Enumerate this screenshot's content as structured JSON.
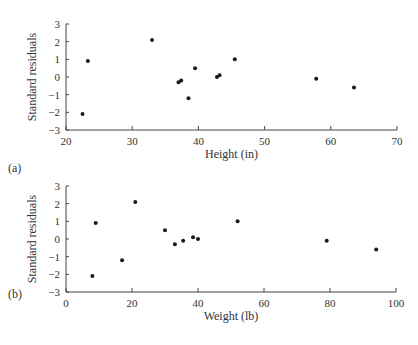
{
  "chart_data": [
    {
      "type": "scatter",
      "panel_label": "(a)",
      "title": "",
      "xlabel": "Height (in)",
      "ylabel": "Standard residuals",
      "xlim": [
        20,
        70
      ],
      "ylim": [
        -3,
        3
      ],
      "xticks": [
        20,
        30,
        40,
        50,
        60,
        70
      ],
      "yticks": [
        3,
        2,
        1,
        0,
        -1,
        -2,
        -3
      ],
      "grid": false,
      "legend": null,
      "series": [
        {
          "name": "residuals",
          "points": [
            {
              "x": 22.5,
              "y": -2.1
            },
            {
              "x": 23.3,
              "y": 0.9
            },
            {
              "x": 33.0,
              "y": 2.1
            },
            {
              "x": 37.0,
              "y": -0.3
            },
            {
              "x": 37.4,
              "y": -0.2
            },
            {
              "x": 38.5,
              "y": -1.2
            },
            {
              "x": 39.5,
              "y": 0.5
            },
            {
              "x": 42.8,
              "y": 0.0
            },
            {
              "x": 43.2,
              "y": 0.1
            },
            {
              "x": 45.5,
              "y": 1.0
            },
            {
              "x": 57.8,
              "y": -0.1
            },
            {
              "x": 63.5,
              "y": -0.6
            }
          ]
        }
      ]
    },
    {
      "type": "scatter",
      "panel_label": "(b)",
      "title": "",
      "xlabel": "Weight (lb)",
      "ylabel": "Standard residuals",
      "xlim": [
        0,
        100
      ],
      "ylim": [
        -3,
        3
      ],
      "xticks": [
        0,
        20,
        40,
        60,
        80,
        100
      ],
      "yticks": [
        3,
        2,
        1,
        0,
        -1,
        -2,
        -3
      ],
      "grid": false,
      "legend": null,
      "series": [
        {
          "name": "residuals",
          "points": [
            {
              "x": 8.0,
              "y": -2.1
            },
            {
              "x": 9.0,
              "y": 0.9
            },
            {
              "x": 17.0,
              "y": -1.2
            },
            {
              "x": 21.0,
              "y": 2.1
            },
            {
              "x": 30.0,
              "y": 0.5
            },
            {
              "x": 33.0,
              "y": -0.3
            },
            {
              "x": 35.5,
              "y": -0.1
            },
            {
              "x": 38.5,
              "y": 0.1
            },
            {
              "x": 40.0,
              "y": 0.0
            },
            {
              "x": 52.0,
              "y": 1.0
            },
            {
              "x": 79.0,
              "y": -0.1
            },
            {
              "x": 94.0,
              "y": -0.6
            }
          ]
        }
      ]
    }
  ],
  "colors": {
    "axis": "#444444",
    "point": "#1a1a1a",
    "text": "#333333"
  }
}
